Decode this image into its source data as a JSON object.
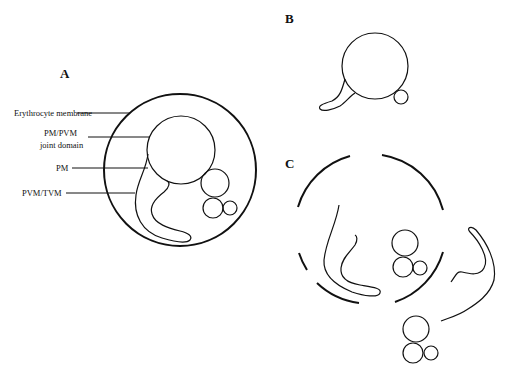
{
  "figure": {
    "panels": [
      {
        "id": "A",
        "label": "A"
      },
      {
        "id": "B",
        "label": "B"
      },
      {
        "id": "C",
        "label": "C"
      }
    ],
    "annotations": {
      "erythrocyte_membrane": "Erythrocyte membrane",
      "pm_pvm_line1": "PM/PVM",
      "pm_pvm_line2": "joint domain",
      "pm": "PM",
      "pvm_tvm": "PVM/TVM"
    },
    "colors": {
      "stroke": "#111111",
      "background": "#ffffff"
    }
  }
}
